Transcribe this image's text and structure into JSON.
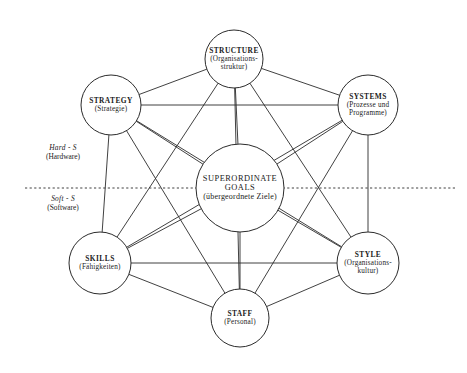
{
  "diagram": {
    "nodes": [
      {
        "id": "structure",
        "en": "STRUCTURE",
        "de": "(Organisations-\nstruktur)",
        "de_lines": [
          "(Organisations-",
          "struktur)"
        ],
        "cx": 234,
        "cy": 59,
        "r": 29
      },
      {
        "id": "strategy",
        "en": "STRATEGY",
        "de_lines": [
          "(Strategie)"
        ],
        "cx": 111,
        "cy": 105,
        "r": 30
      },
      {
        "id": "systems",
        "en": "SYSTEMS",
        "de_lines": [
          "(Prozesse und",
          "Programme)"
        ],
        "cx": 368,
        "cy": 105,
        "r": 30
      },
      {
        "id": "skills",
        "en": "SKILLS",
        "de_lines": [
          "(Fähigkeiten)"
        ],
        "cx": 100,
        "cy": 263,
        "r": 31
      },
      {
        "id": "style",
        "en": "STYLE",
        "de_lines": [
          "(Organisations-",
          "kultur)"
        ],
        "cx": 368,
        "cy": 263,
        "r": 31
      },
      {
        "id": "staff",
        "en": "STAFF",
        "de_lines": [
          "(Personal)"
        ],
        "cx": 240,
        "cy": 318,
        "r": 29
      },
      {
        "id": "goals",
        "en": "SUPERORDINATE GOALS",
        "en_lines": [
          "SUPERORDINATE",
          "GOALS"
        ],
        "de_lines": [
          "(übergeordnete Ziele)"
        ],
        "cx": 240,
        "cy": 188,
        "r": 44
      }
    ],
    "side_labels": [
      {
        "id": "hard-s",
        "tag": "Hard - S",
        "sub": "(Hardware)",
        "x": 63,
        "y": 152
      },
      {
        "id": "soft-s",
        "tag": "Soft - S",
        "sub": "(Software)",
        "x": 63,
        "y": 203
      }
    ],
    "divider": {
      "y": 188,
      "x1": 25,
      "x2": 455,
      "style": "dashed"
    },
    "edges": [
      [
        "structure",
        "strategy"
      ],
      [
        "structure",
        "systems"
      ],
      [
        "structure",
        "skills"
      ],
      [
        "structure",
        "style"
      ],
      [
        "structure",
        "staff"
      ],
      [
        "structure",
        "goals"
      ],
      [
        "strategy",
        "systems"
      ],
      [
        "strategy",
        "skills"
      ],
      [
        "strategy",
        "style"
      ],
      [
        "strategy",
        "staff"
      ],
      [
        "strategy",
        "goals"
      ],
      [
        "systems",
        "skills"
      ],
      [
        "systems",
        "style"
      ],
      [
        "systems",
        "staff"
      ],
      [
        "systems",
        "goals"
      ],
      [
        "skills",
        "style"
      ],
      [
        "skills",
        "staff"
      ],
      [
        "skills",
        "goals"
      ],
      [
        "style",
        "staff"
      ],
      [
        "style",
        "goals"
      ],
      [
        "staff",
        "goals"
      ]
    ],
    "colors": {
      "stroke": "#2b2b2b",
      "fill": "#ffffff",
      "background": "#ffffff",
      "text": "#1a1a1a"
    }
  }
}
